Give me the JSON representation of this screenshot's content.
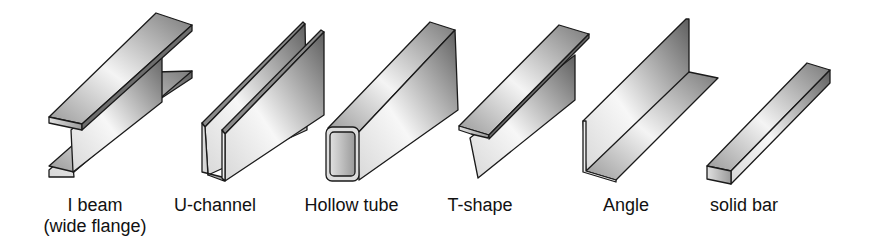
{
  "figure": {
    "shapes": [
      {
        "id": "i-beam",
        "label": "I beam",
        "sublabel": "(wide flange)"
      },
      {
        "id": "u-channel",
        "label": "U-channel"
      },
      {
        "id": "hollow-tube",
        "label": "Hollow tube"
      },
      {
        "id": "t-shape",
        "label": "T-shape"
      },
      {
        "id": "angle",
        "label": "Angle"
      },
      {
        "id": "solid-bar",
        "label": "solid bar"
      }
    ],
    "colors": {
      "outline": "#1a1a1a",
      "light": "#f2f2f2",
      "mid": "#b5b5b5",
      "dark": "#6a6a6a"
    }
  }
}
